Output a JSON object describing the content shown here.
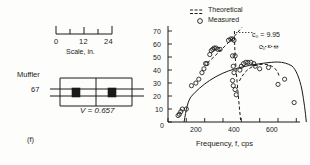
{
  "figure": {
    "panel_label": "(f)",
    "left_panel": {
      "scale_bar": {
        "ticks": [
          "0",
          "12",
          "24"
        ],
        "caption": "Scale, in."
      },
      "muffler": {
        "name_line1": "Muffler",
        "name_line2": "67",
        "volume_label": "V = 0.657"
      }
    }
  },
  "chart_data": {
    "type": "scatter",
    "title": "",
    "xlabel": "Frequency, f, cps",
    "ylabel": "Attenuation, db",
    "xlim": [
      0,
      720
    ],
    "ylim": [
      0,
      74
    ],
    "xticks": [
      0,
      100,
      200,
      300,
      400,
      500,
      600,
      700
    ],
    "xticklabels": [
      "0",
      "",
      "200",
      "",
      "400",
      "",
      "600",
      ""
    ],
    "yticks": [
      0,
      10,
      20,
      30,
      40,
      50,
      60,
      70
    ],
    "yticklabels": [
      "0",
      "10",
      "20",
      "30",
      "40",
      "50",
      "60",
      "70"
    ],
    "grid": false,
    "legend": {
      "position": "top-center",
      "entries": [
        {
          "label": "Theoretical",
          "marker": "double-dashed-line"
        },
        {
          "label": "Measured",
          "marker": "open-circle"
        }
      ]
    },
    "annotations": [
      {
        "text": "c₀ = 9.95",
        "x": 560,
        "y": 64
      },
      {
        "text": "c₀ = ∞",
        "x": 590,
        "y": 56
      }
    ],
    "series": [
      {
        "name": "Measured",
        "type": "scatter",
        "marker": "open-circle",
        "points": [
          [
            55,
            5
          ],
          [
            62,
            6
          ],
          [
            70,
            8
          ],
          [
            78,
            10
          ],
          [
            100,
            10
          ],
          [
            128,
            28
          ],
          [
            152,
            30
          ],
          [
            168,
            33
          ],
          [
            185,
            38
          ],
          [
            196,
            41
          ],
          [
            205,
            45
          ],
          [
            212,
            45
          ],
          [
            228,
            52
          ],
          [
            236,
            55
          ],
          [
            244,
            56
          ],
          [
            252,
            57
          ],
          [
            262,
            57
          ],
          [
            272,
            56
          ],
          [
            284,
            56
          ],
          [
            330,
            63
          ],
          [
            342,
            64
          ],
          [
            352,
            64
          ],
          [
            360,
            63
          ],
          [
            352,
            51
          ],
          [
            366,
            51
          ],
          [
            356,
            43
          ],
          [
            360,
            38
          ],
          [
            352,
            32
          ],
          [
            356,
            28
          ],
          [
            366,
            25
          ],
          [
            372,
            21
          ],
          [
            392,
            40
          ],
          [
            400,
            43
          ],
          [
            412,
            45
          ],
          [
            424,
            46
          ],
          [
            436,
            46
          ],
          [
            452,
            46
          ],
          [
            468,
            45
          ],
          [
            476,
            43
          ],
          [
            500,
            41
          ],
          [
            548,
            42
          ],
          [
            600,
            29
          ],
          [
            636,
            33
          ],
          [
            688,
            15
          ]
        ]
      },
      {
        "name": "Theoretical c0 = infinity",
        "type": "line",
        "style": "solid",
        "points": [
          [
            88,
            0
          ],
          [
            100,
            12
          ],
          [
            115,
            22
          ],
          [
            130,
            29
          ],
          [
            150,
            35
          ],
          [
            170,
            40
          ],
          [
            190,
            44
          ],
          [
            210,
            48
          ],
          [
            230,
            52
          ],
          [
            250,
            55
          ],
          [
            270,
            57
          ],
          [
            290,
            59
          ],
          [
            310,
            61
          ],
          [
            330,
            62
          ],
          [
            350,
            63
          ],
          [
            370,
            63
          ],
          [
            400,
            62
          ],
          [
            430,
            61
          ],
          [
            460,
            59
          ],
          [
            490,
            57
          ],
          [
            520,
            54
          ],
          [
            550,
            50
          ],
          [
            580,
            45
          ],
          [
            610,
            39
          ],
          [
            640,
            30
          ],
          [
            665,
            20
          ],
          [
            685,
            8
          ],
          [
            694,
            0
          ]
        ]
      },
      {
        "name": "Theoretical c0 = 9.95 rising branch",
        "type": "line",
        "style": "dashed",
        "points": [
          [
            215,
            46
          ],
          [
            240,
            54
          ],
          [
            265,
            60
          ],
          [
            290,
            66
          ],
          [
            305,
            70
          ],
          [
            315,
            73
          ]
        ]
      },
      {
        "name": "Theoretical c0 = 9.95 asymptote",
        "type": "line",
        "style": "dashed",
        "points": [
          [
            362,
            70
          ],
          [
            363,
            58
          ],
          [
            366,
            46
          ],
          [
            370,
            34
          ],
          [
            374,
            22
          ],
          [
            378,
            10
          ],
          [
            380,
            2
          ]
        ]
      },
      {
        "name": "Theoretical c0 = 9.95 secondary lobe",
        "type": "line",
        "style": "dashed",
        "points": [
          [
            386,
            32
          ],
          [
            396,
            40
          ],
          [
            410,
            45
          ],
          [
            428,
            48
          ],
          [
            446,
            48
          ],
          [
            462,
            46
          ],
          [
            474,
            42
          ],
          [
            480,
            38
          ]
        ]
      }
    ]
  }
}
